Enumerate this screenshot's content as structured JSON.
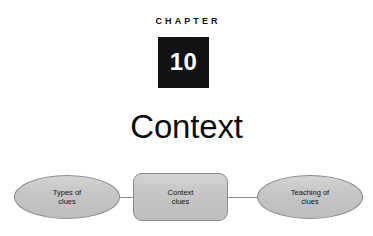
{
  "page": {
    "background_color": "#ffffff",
    "width": 373,
    "height": 236
  },
  "header": {
    "chapter_label": "CHAPTER",
    "chapter_number": "10",
    "chapter_number_box_color": "#121212",
    "chapter_number_text_color": "#ffffff",
    "title": "Context"
  },
  "diagram": {
    "type": "concept-map",
    "node_fill_color": "#c6c6c6",
    "node_border_color": "#8b8b8b",
    "connector_color": "#8f8f8f",
    "nodes": [
      {
        "id": "types-of-clues",
        "shape": "ellipse",
        "label": "Types of\nclues",
        "line1": "Types of",
        "line2": "clues"
      },
      {
        "id": "context-clues",
        "shape": "rounded-rect",
        "label": "Context\nclues",
        "line1": "Context",
        "line2": "clues"
      },
      {
        "id": "teaching-of-clues",
        "shape": "ellipse",
        "label": "Teaching of\nclues",
        "line1": "Teaching of",
        "line2": "clues"
      }
    ],
    "connectors": [
      {
        "from": "types-of-clues",
        "to": "context-clues"
      },
      {
        "from": "context-clues",
        "to": "teaching-of-clues"
      }
    ]
  }
}
